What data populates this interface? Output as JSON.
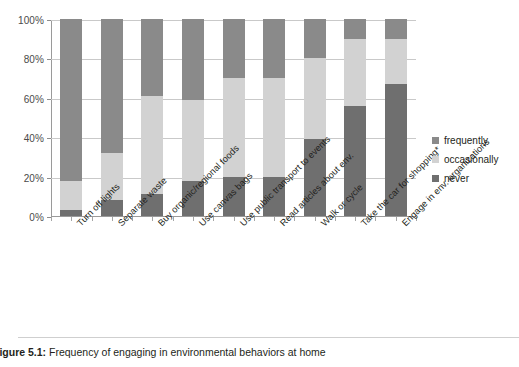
{
  "figure": {
    "caption_label": "Figure 5.1:",
    "caption_text": "Frequency of engaging in environmental behaviors at home"
  },
  "legend": {
    "position": "right",
    "items": [
      {
        "label": "frequently",
        "color": "#8a8a8a"
      },
      {
        "label": "occasionally",
        "color": "#d2d2d2"
      },
      {
        "label": "never",
        "color": "#6f6f6f"
      }
    ]
  },
  "axis": {
    "y_ticks": [
      "0%",
      "20%",
      "40%",
      "60%",
      "80%",
      "100%"
    ],
    "y_min": 0,
    "y_max": 100
  },
  "chart_data": {
    "type": "bar",
    "title": "Frequency of engaging in environmental behaviors at home",
    "xlabel": "",
    "ylabel": "",
    "ylim": [
      0,
      100
    ],
    "ytick_labels": [
      "0%",
      "20%",
      "40%",
      "60%",
      "80%",
      "100%"
    ],
    "grid": true,
    "stacked": true,
    "stack_order_bottom_to_top": [
      "never",
      "occasionally",
      "frequently"
    ],
    "legend_position": "right",
    "categories": [
      "Turn off lights",
      "Separate waste",
      "Buy organic/regional foods",
      "Use canvas bags",
      "Use public transport to events",
      "Read articles about env.",
      "Walk or cycle",
      "Take the car for shopping*",
      "Engage in env. organizations"
    ],
    "series": [
      {
        "name": "never",
        "color": "#6f6f6f",
        "values": [
          3,
          8,
          11,
          18,
          20,
          20,
          39,
          56,
          67
        ]
      },
      {
        "name": "occasionally",
        "color": "#d2d2d2",
        "values": [
          15,
          24,
          50,
          41,
          50,
          50,
          41,
          34,
          23
        ]
      },
      {
        "name": "frequently",
        "color": "#8a8a8a",
        "values": [
          82,
          68,
          39,
          41,
          30,
          30,
          20,
          10,
          10
        ]
      }
    ],
    "cumulative_tops": {
      "never": [
        3,
        8,
        11,
        18,
        20,
        20,
        39,
        56,
        67
      ],
      "occasionally": [
        18,
        32,
        61,
        59,
        70,
        70,
        80,
        90,
        90
      ]
    }
  }
}
